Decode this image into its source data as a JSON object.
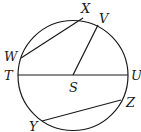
{
  "diagram": {
    "type": "circle-geometry",
    "center": {
      "label": "S",
      "x": 73,
      "y": 75
    },
    "radius": 55,
    "points": [
      {
        "label": "X",
        "x": 83,
        "y": 18,
        "lx": 81,
        "ly": 13
      },
      {
        "label": "V",
        "x": 98,
        "y": 25,
        "lx": 99,
        "ly": 23
      },
      {
        "label": "W",
        "x": 21,
        "y": 58,
        "lx": 6,
        "ly": 61
      },
      {
        "label": "T",
        "x": 18,
        "y": 75,
        "lx": 4,
        "ly": 80
      },
      {
        "label": "U",
        "x": 128,
        "y": 75,
        "lx": 131,
        "ly": 80
      },
      {
        "label": "Z",
        "x": 121,
        "y": 100,
        "lx": 127,
        "ly": 108
      },
      {
        "label": "Y",
        "x": 42,
        "y": 121,
        "lx": 29,
        "ly": 132
      },
      {
        "label": "S",
        "x": 73,
        "y": 75,
        "lx": 69,
        "ly": 92
      }
    ],
    "segments": [
      {
        "name": "chord-WX",
        "from": "W",
        "to": "X"
      },
      {
        "name": "radius-SV",
        "from": "S",
        "to": "V"
      },
      {
        "name": "diameter-TU",
        "from": "T",
        "to": "U"
      },
      {
        "name": "chord-YZ",
        "from": "Y",
        "to": "Z"
      }
    ],
    "stroke_color": "#1a1a1a"
  },
  "labels": {
    "X": "X",
    "V": "V",
    "W": "W",
    "T": "T",
    "U": "U",
    "Z": "Z",
    "Y": "Y",
    "S": "S"
  }
}
